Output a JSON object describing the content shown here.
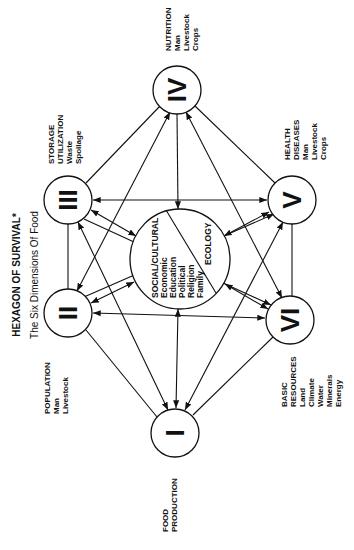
{
  "title": "HEXAGON OF SURVIVAL*",
  "subtitle": "The Six Dimensions Of Food",
  "orientation": "rotated 90° counter-clockwise",
  "nodes": {
    "I": {
      "numeral": "I",
      "heading": [
        "FOOD",
        "PRODUCTION"
      ],
      "items": []
    },
    "II": {
      "numeral": "II",
      "heading": [
        "POPULATION"
      ],
      "items": [
        "Man",
        "Livestock"
      ]
    },
    "III": {
      "numeral": "III",
      "heading": [
        "STORAGE",
        "UTILIZATION"
      ],
      "items": [
        "Waste",
        "Spoilage"
      ]
    },
    "IV": {
      "numeral": "IV",
      "heading": [
        "NUTRITION"
      ],
      "items": [
        "Man",
        "Livestock",
        "Crops"
      ]
    },
    "V": {
      "numeral": "V",
      "heading": [
        "HEALTH",
        "DISEASES"
      ],
      "items": [
        "Man",
        "Livestock",
        "Crops"
      ]
    },
    "VI": {
      "numeral": "VI",
      "heading": [
        "BASIC",
        "RESOURCES"
      ],
      "items": [
        "Land",
        "Climate",
        "Water",
        "Minerals",
        "Energy"
      ]
    }
  },
  "center": {
    "left_heading": "SOCIAL/CULTURAL",
    "left_items": [
      "Economic",
      "Education",
      "Political",
      "Religion",
      "Family"
    ],
    "right_heading": "ECOLOGY"
  }
}
